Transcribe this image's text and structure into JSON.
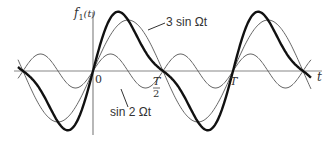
{
  "chart_data": {
    "type": "line",
    "title": "",
    "ylabel": "f1(t)",
    "xlabel": "t",
    "tick_labels": [
      "0",
      "T/2",
      "T"
    ],
    "series": [
      {
        "name": "3 sin Ωt",
        "amplitude": 3,
        "harmonic": 1,
        "style": "thin"
      },
      {
        "name": "sin 2 Ωt",
        "amplitude": 1,
        "harmonic": 2,
        "style": "thin"
      },
      {
        "name": "f1(t) = 3 sin Ωt + sin 2 Ωt",
        "amplitude": null,
        "harmonic": null,
        "style": "thick"
      }
    ],
    "x_range": [
      "-T/2",
      "T + T/2"
    ],
    "grid": false
  },
  "labels": {
    "y_axis": "f",
    "y_axis_sub": "1",
    "y_axis_arg": "(t)",
    "x_axis": "t",
    "origin": "0",
    "half_period_num": "T",
    "half_period_den": "2",
    "period": "T",
    "series_3sin": "3 sin Ωt",
    "series_sin2": "sin 2 Ωt"
  },
  "colors": {
    "thin": "#666666",
    "thick": "#111111",
    "axis": "#888888"
  }
}
